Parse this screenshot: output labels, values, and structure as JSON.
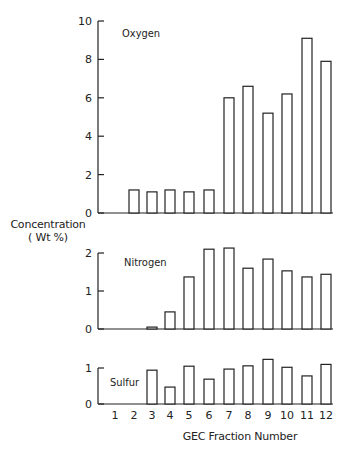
{
  "chart_data": {
    "type": "bar",
    "title": "",
    "xlabel": "GEC Fraction Number",
    "ylabel": "Concentration (Wt %)",
    "categories": [
      "1",
      "2",
      "3",
      "4",
      "5",
      "6",
      "7",
      "8",
      "9",
      "10",
      "11",
      "12"
    ],
    "panels": [
      {
        "name": "Oxygen",
        "values": [
          null,
          1.2,
          1.1,
          1.2,
          1.1,
          1.2,
          6.0,
          6.6,
          5.2,
          6.2,
          9.1,
          7.9
        ],
        "ylim": [
          0,
          10
        ],
        "yticks": [
          0,
          2,
          4,
          6,
          8,
          10
        ]
      },
      {
        "name": "Nitrogen",
        "values": [
          null,
          null,
          0.05,
          0.45,
          1.37,
          2.1,
          2.13,
          1.6,
          1.84,
          1.53,
          1.37,
          1.44
        ],
        "ylim": [
          0,
          2
        ],
        "yticks": [
          0,
          1,
          2
        ]
      },
      {
        "name": "Sulfur",
        "values": [
          null,
          null,
          0.94,
          0.47,
          1.05,
          0.69,
          0.97,
          1.06,
          1.24,
          1.02,
          0.78,
          1.1
        ],
        "ylim": [
          0,
          1
        ],
        "yticks": [
          0,
          1
        ]
      }
    ],
    "grid": false,
    "legend": "none (panel labels inside plots)"
  },
  "labels": {
    "ylabel_line1": "Concentration",
    "ylabel_line2": "( Wt %)",
    "xlabel": "GEC Fraction Number"
  },
  "colors": {
    "bar_fill": "#ffffff",
    "bar_stroke": "#222222",
    "axis": "#222222"
  }
}
